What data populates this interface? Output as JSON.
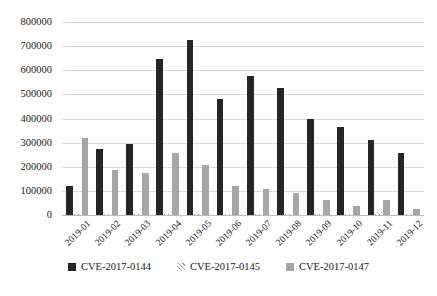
{
  "chart_data": {
    "type": "bar",
    "title": "",
    "subtitle": "",
    "xlabel": "",
    "ylabel": "",
    "categories": [
      "2019-01",
      "2019-02",
      "2019-03",
      "2019-04",
      "2019-05",
      "2019-06",
      "2019-07",
      "2019-08",
      "2019-09",
      "2019-10",
      "2019-11",
      "2019-12"
    ],
    "series": [
      {
        "name": "CVE-2017-0144",
        "color": "#262626",
        "values": [
          120000,
          275000,
          293000,
          645000,
          727000,
          480000,
          578000,
          527000,
          399000,
          363000,
          312000,
          258000
        ]
      },
      {
        "name": "CVE-2017-0145",
        "color": "#d0d0d0",
        "values": [
          3000,
          3000,
          4000,
          5000,
          5000,
          4000,
          5000,
          5000,
          6000,
          5000,
          14000,
          4000
        ]
      },
      {
        "name": "CVE-2017-0147",
        "color": "#a6a6a6",
        "values": [
          319000,
          185000,
          176000,
          255000,
          208000,
          122000,
          106000,
          90000,
          62000,
          39000,
          61000,
          23000
        ]
      }
    ],
    "ylim": [
      0,
      800000
    ],
    "y_ticks": [
      0,
      100000,
      200000,
      300000,
      400000,
      500000,
      600000,
      700000,
      800000
    ],
    "y_tick_labels": [
      "0",
      "100000",
      "200000",
      "300000",
      "400000",
      "500000",
      "600000",
      "700000",
      "800000"
    ],
    "grid": true,
    "grid_axis": "y",
    "legend_position": "bottom",
    "legend": [
      "CVE-2017-0144",
      "CVE-2017-0145",
      "CVE-2017-0147"
    ]
  }
}
